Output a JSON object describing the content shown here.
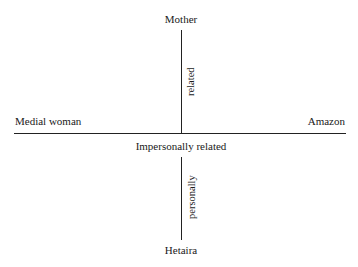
{
  "diagram": {
    "poles": {
      "top": "Mother",
      "bottom": "Hetaira",
      "left": "Medial woman",
      "right": "Amazon"
    },
    "axis_labels": {
      "upper_vertical": "related",
      "lower_vertical": "personally",
      "horizontal_center": "Impersonally related"
    }
  }
}
